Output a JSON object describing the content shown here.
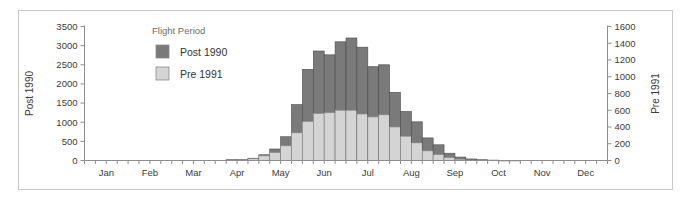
{
  "figure": {
    "background_color": "#ffffff",
    "frame_color": "#c9c9c9"
  },
  "legend": {
    "title": "Flight Period",
    "items": [
      {
        "label": "Post 1990",
        "color": "#7a7a7a"
      },
      {
        "label": "Pre 1991",
        "color": "#d4d4d4"
      }
    ]
  },
  "axes": {
    "left": {
      "title": "Post 1990",
      "ticks": [
        "0",
        "500",
        "1000",
        "1500",
        "2000",
        "2500",
        "3000",
        "3500"
      ],
      "min": 0,
      "max": 3500,
      "step": 500
    },
    "right": {
      "title": "Pre 1991",
      "ticks": [
        "0",
        "200",
        "400",
        "600",
        "800",
        "1000",
        "1200",
        "1400",
        "1600"
      ],
      "min": 0,
      "max": 1600,
      "step": 200
    },
    "bottom": {
      "ticks": [
        "Jan",
        "Feb",
        "Mar",
        "Apr",
        "May",
        "Jun",
        "Jul",
        "Aug",
        "Sep",
        "Oct",
        "Nov",
        "Dec"
      ]
    }
  },
  "chart_data": {
    "type": "bar",
    "title": "",
    "subtitle": "",
    "xlabel": "",
    "ylabel": "Post 1990",
    "y2label": "Pre 1991",
    "ylim": [
      0,
      3500
    ],
    "y2lim": [
      0,
      1600
    ],
    "grid": false,
    "legend_position": "inside-top-left",
    "legend_title": "Flight Period",
    "stacked": true,
    "bin": "week",
    "categories": [
      "Jan w1",
      "Jan w2",
      "Jan w3",
      "Jan w4",
      "Feb w1",
      "Feb w2",
      "Feb w3",
      "Feb w4",
      "Mar w1",
      "Mar w2",
      "Mar w3",
      "Mar w4",
      "Apr w1",
      "Apr w2",
      "Apr w3",
      "Apr w4",
      "May w1",
      "May w2",
      "May w3",
      "May w4",
      "Jun w1",
      "Jun w2",
      "Jun w3",
      "Jun w4",
      "Jul w1",
      "Jul w2",
      "Jul w3",
      "Jul w4",
      "Aug w1",
      "Aug w2",
      "Aug w3",
      "Aug w4",
      "Sep w1",
      "Sep w2",
      "Sep w3",
      "Sep w4",
      "Oct w1",
      "Oct w2",
      "Oct w3",
      "Oct w4",
      "Nov w1",
      "Nov w2",
      "Nov w3",
      "Nov w4",
      "Dec w1",
      "Dec w2",
      "Dec w3",
      "Dec w4"
    ],
    "series": [
      {
        "name": "Post 1990",
        "color": "#7a7a7a",
        "axis": "left",
        "values": [
          0,
          0,
          0,
          0,
          0,
          0,
          0,
          0,
          0,
          0,
          0,
          0,
          0,
          20,
          30,
          60,
          150,
          300,
          620,
          1460,
          2380,
          2860,
          2760,
          3100,
          3200,
          2960,
          2450,
          2500,
          1780,
          1280,
          1010,
          590,
          410,
          190,
          90,
          40,
          20,
          10,
          5,
          5,
          0,
          0,
          0,
          0,
          0,
          0,
          0,
          0
        ]
      },
      {
        "name": "Pre 1991",
        "color": "#d4d4d4",
        "axis": "right",
        "values": [
          0,
          0,
          0,
          0,
          0,
          0,
          0,
          0,
          0,
          0,
          0,
          0,
          0,
          5,
          10,
          20,
          55,
          95,
          175,
          330,
          465,
          560,
          570,
          600,
          600,
          555,
          520,
          545,
          400,
          290,
          210,
          115,
          70,
          35,
          15,
          5,
          0,
          0,
          0,
          0,
          0,
          0,
          0,
          0,
          0,
          0,
          0,
          0
        ]
      }
    ]
  }
}
